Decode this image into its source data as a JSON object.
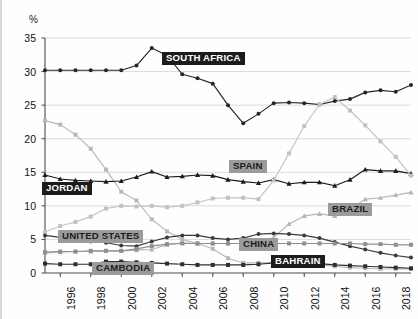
{
  "chart_data": {
    "type": "line",
    "title": "",
    "xlabel": "",
    "ylabel": "%",
    "ylim": [
      0,
      35
    ],
    "yticks": [
      0,
      5,
      10,
      15,
      20,
      25,
      30,
      35
    ],
    "xlim": [
      1995,
      2019
    ],
    "xticks": [
      1996,
      1998,
      2000,
      2002,
      2004,
      2006,
      2008,
      2010,
      2012,
      2014,
      2016,
      2018
    ],
    "xtick_labels": [
      "1996",
      "1998",
      "2000",
      "2002",
      "2004",
      "2006",
      "2008",
      "2010",
      "2012",
      "2014",
      "2016",
      "2018"
    ],
    "grid": "horizontal",
    "legend": "inline-labels",
    "x": [
      1995,
      1996,
      1997,
      1998,
      1999,
      2000,
      2001,
      2002,
      2003,
      2004,
      2005,
      2006,
      2007,
      2008,
      2009,
      2010,
      2011,
      2012,
      2013,
      2014,
      2015,
      2016,
      2017,
      2018,
      2019
    ],
    "series": [
      {
        "name": "SOUTH AFRICA",
        "color": "#262626",
        "marker": "circle",
        "label_style": "dark",
        "values": [
          30.2,
          30.2,
          30.2,
          30.2,
          30.2,
          30.2,
          30.9,
          33.5,
          32.4,
          29.6,
          29.0,
          28.2,
          25.0,
          22.3,
          23.7,
          25.3,
          25.4,
          25.3,
          25.1,
          25.6,
          25.9,
          26.9,
          27.2,
          27.0,
          28.0
        ]
      },
      {
        "name": "BAHRAIN",
        "color": "#b9b9b9",
        "marker": "square",
        "label_style": "dark",
        "values": [
          22.7,
          22.1,
          20.6,
          18.5,
          15.4,
          12.1,
          10.8,
          8.0,
          6.2,
          5.0,
          4.4,
          3.6,
          2.2,
          1.5,
          1.5,
          1.5,
          1.4,
          1.3,
          1.2,
          1.0,
          0.8,
          0.7,
          0.6,
          0.6,
          0.6
        ]
      },
      {
        "name": "JORDAN",
        "color": "#1c1c1c",
        "marker": "triangle",
        "label_style": "dark",
        "values": [
          14.6,
          14.0,
          13.8,
          13.7,
          13.6,
          13.7,
          14.3,
          15.1,
          14.3,
          14.4,
          14.6,
          14.5,
          13.9,
          13.6,
          13.4,
          13.9,
          13.3,
          13.5,
          13.5,
          13.0,
          13.9,
          15.4,
          15.2,
          15.2,
          14.8
        ]
      },
      {
        "name": "SPAIN",
        "color": "#c2c2c2",
        "marker": "square",
        "label_style": "gray",
        "values": [
          6.1,
          7.0,
          7.6,
          8.4,
          9.6,
          10.0,
          9.9,
          10.0,
          9.8,
          10.0,
          10.5,
          11.1,
          11.2,
          11.2,
          11.0,
          13.8,
          17.8,
          21.9,
          25.1,
          26.2,
          24.2,
          22.0,
          19.6,
          17.3,
          14.5
        ]
      },
      {
        "name": "BRAZIL",
        "color": "#b5b5b5",
        "marker": "triangle",
        "label_style": "gray",
        "values": [
          3.0,
          3.1,
          3.2,
          3.2,
          3.3,
          3.3,
          3.4,
          3.5,
          4.2,
          4.5,
          4.4,
          4.4,
          4.4,
          4.4,
          4.4,
          5.3,
          7.3,
          8.5,
          8.8,
          8.5,
          9.5,
          11.0,
          11.2,
          11.6,
          12.0
        ]
      },
      {
        "name": "UNITED STATES",
        "color": "#3a3a3a",
        "marker": "circle",
        "label_style": "gray",
        "values": [
          5.6,
          5.3,
          5.0,
          4.7,
          4.5,
          4.1,
          4.0,
          4.7,
          5.3,
          5.6,
          5.6,
          5.2,
          5.0,
          5.2,
          5.8,
          5.9,
          5.8,
          5.6,
          5.2,
          4.6,
          4.0,
          3.5,
          3.0,
          2.6,
          2.3
        ]
      },
      {
        "name": "CHINA",
        "color": "#8f8f8f",
        "marker": "square",
        "label_style": "gray",
        "values": [
          3.1,
          3.2,
          3.2,
          3.3,
          3.3,
          3.3,
          3.6,
          4.0,
          4.3,
          4.4,
          4.4,
          4.4,
          4.4,
          4.4,
          4.4,
          4.4,
          4.4,
          4.4,
          4.4,
          4.4,
          4.4,
          4.3,
          4.3,
          4.2,
          4.2
        ]
      },
      {
        "name": "CAMBODIA",
        "color": "#2e2e2e",
        "marker": "square",
        "label_style": "gray",
        "values": [
          1.4,
          1.3,
          1.3,
          1.3,
          1.7,
          1.7,
          1.6,
          1.5,
          1.4,
          1.3,
          1.2,
          1.2,
          1.2,
          1.2,
          1.3,
          1.5,
          1.6,
          1.5,
          1.4,
          1.2,
          1.1,
          1.0,
          0.9,
          0.8,
          0.7
        ]
      }
    ],
    "series_labels": [
      {
        "name": "SOUTH AFRICA",
        "style": "dark",
        "x": 160,
        "y": 52
      },
      {
        "name": "SPAIN",
        "style": "gray",
        "x": 227,
        "y": 160
      },
      {
        "name": "JORDAN",
        "style": "dark",
        "x": 40,
        "y": 182
      },
      {
        "name": "BRAZIL",
        "style": "gray",
        "x": 326,
        "y": 203
      },
      {
        "name": "UNITED STATES",
        "style": "gray",
        "x": 56,
        "y": 230
      },
      {
        "name": "CHINA",
        "style": "gray",
        "x": 237,
        "y": 238
      },
      {
        "name": "CAMBODIA",
        "style": "gray",
        "x": 90,
        "y": 262
      },
      {
        "name": "BAHRAIN",
        "style": "dark",
        "x": 269,
        "y": 255
      }
    ]
  }
}
